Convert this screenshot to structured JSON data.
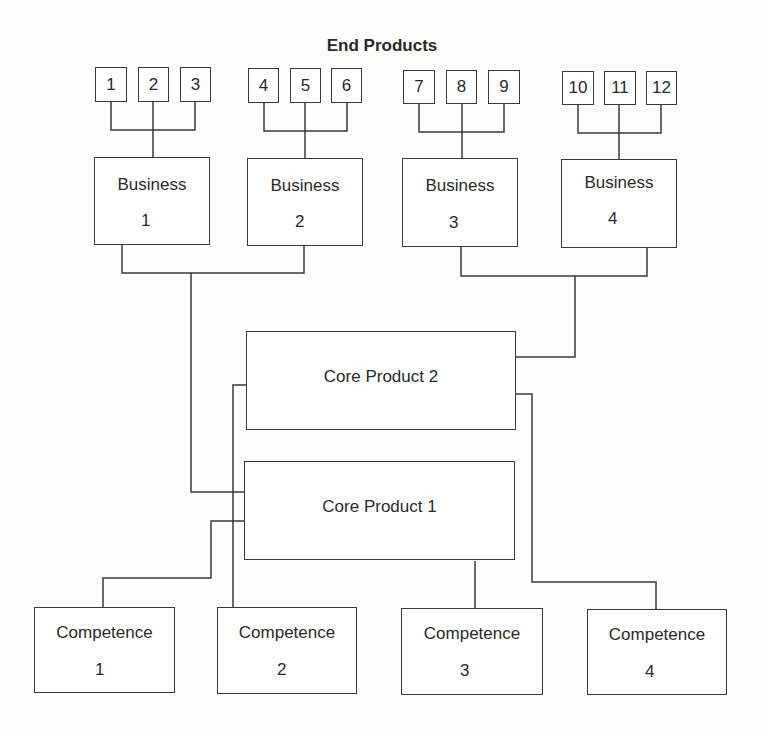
{
  "title": "End Products",
  "end_products": [
    "1",
    "2",
    "3",
    "4",
    "5",
    "6",
    "7",
    "8",
    "9",
    "10",
    "11",
    "12"
  ],
  "businesses": [
    {
      "label": "Business",
      "number": "1"
    },
    {
      "label": "Business",
      "number": "2"
    },
    {
      "label": "Business",
      "number": "3"
    },
    {
      "label": "Business",
      "number": "4"
    }
  ],
  "core_products": [
    {
      "label": "Core Product 1"
    },
    {
      "label": "Core Product 2"
    }
  ],
  "competences": [
    {
      "label": "Competence",
      "number": "1"
    },
    {
      "label": "Competence",
      "number": "2"
    },
    {
      "label": "Competence",
      "number": "3"
    },
    {
      "label": "Competence",
      "number": "4"
    }
  ],
  "colors": {
    "line": "#3a3a3a",
    "text": "#2a2a2a",
    "background": "#fdfdfb"
  }
}
